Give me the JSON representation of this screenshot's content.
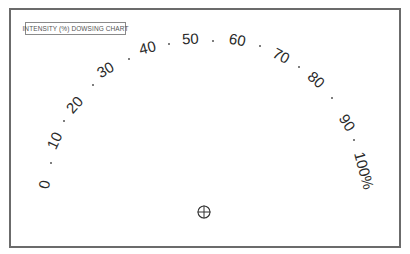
{
  "title": "INTENSITY (%) DOWSING CHART",
  "scale": {
    "labels": [
      {
        "text": "0",
        "x": 44,
        "y": 184,
        "rot": -80
      },
      {
        "text": "10",
        "x": 54,
        "y": 140,
        "rot": -65
      },
      {
        "text": "20",
        "x": 74,
        "y": 104,
        "rot": -48
      },
      {
        "text": "30",
        "x": 105,
        "y": 69,
        "rot": -30
      },
      {
        "text": "40",
        "x": 147,
        "y": 47,
        "rot": -14
      },
      {
        "text": "50",
        "x": 190,
        "y": 38,
        "rot": -2
      },
      {
        "text": "60",
        "x": 237,
        "y": 39,
        "rot": 10
      },
      {
        "text": "70",
        "x": 281,
        "y": 55,
        "rot": 28
      },
      {
        "text": "80",
        "x": 316,
        "y": 79,
        "rot": 42
      },
      {
        "text": "90",
        "x": 347,
        "y": 122,
        "rot": 58
      },
      {
        "text": "100%",
        "x": 364,
        "y": 170,
        "rot": 75
      }
    ],
    "dots": [
      {
        "x": 51,
        "y": 163
      },
      {
        "x": 64,
        "y": 121
      },
      {
        "x": 93,
        "y": 85
      },
      {
        "x": 129,
        "y": 59
      },
      {
        "x": 169,
        "y": 44
      },
      {
        "x": 213,
        "y": 41
      },
      {
        "x": 260,
        "y": 46
      },
      {
        "x": 299,
        "y": 67
      },
      {
        "x": 332,
        "y": 98
      },
      {
        "x": 354,
        "y": 140
      }
    ]
  },
  "pendulum_center": {
    "icon": "crosshair-circle-icon",
    "x": 204,
    "y": 212
  }
}
